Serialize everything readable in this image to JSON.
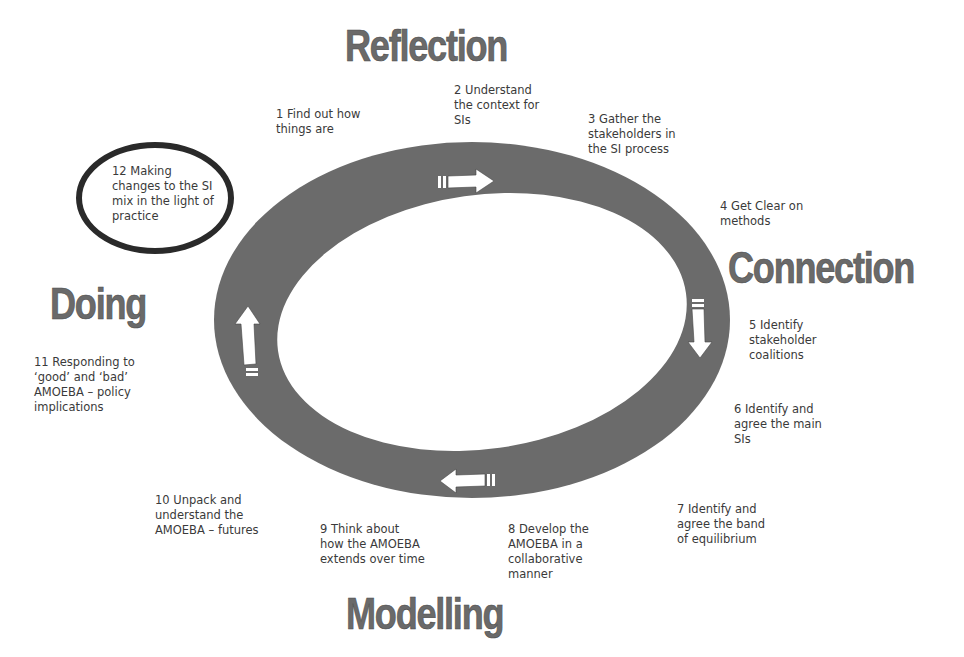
{
  "diagram": {
    "phases": [
      {
        "label": "Reflection"
      },
      {
        "label": "Connection"
      },
      {
        "label": "Modelling"
      },
      {
        "label": "Doing"
      }
    ],
    "steps": [
      {
        "text": "1 Find out how\nthings are"
      },
      {
        "text": "2 Understand\nthe context for\nSIs"
      },
      {
        "text": "3 Gather the\nstakeholders in\nthe SI process"
      },
      {
        "text": "4 Get Clear on\nmethods"
      },
      {
        "text": "5 Identify\nstakeholder\ncoalitions"
      },
      {
        "text": "6 Identify and\nagree the main\nSIs"
      },
      {
        "text": "7 Identify and\nagree the band\nof equilibrium"
      },
      {
        "text": "8 Develop the\nAMOEBA in a\ncollaborative\nmanner"
      },
      {
        "text": "9 Think about\nhow the AMOEBA\nextends over time"
      },
      {
        "text": "10 Unpack and\nunderstand the\nAMOEBA – futures"
      },
      {
        "text": "11 Responding to\n‘good’ and ‘bad’\nAMOEBA – policy\nimplications"
      },
      {
        "text": "12 Making\nchanges to the SI\nmix in the light of\npractice"
      }
    ],
    "arrows": [
      {
        "direction": "right",
        "position": "top"
      },
      {
        "direction": "down",
        "position": "right"
      },
      {
        "direction": "left",
        "position": "bottom"
      },
      {
        "direction": "up",
        "position": "left"
      }
    ],
    "colors": {
      "ring": "#6b6b6b",
      "heading": "#6a6a6a",
      "text": "#3a3a3a",
      "highlight_circle": "#2a2a2a",
      "arrow": "#ffffff"
    }
  }
}
